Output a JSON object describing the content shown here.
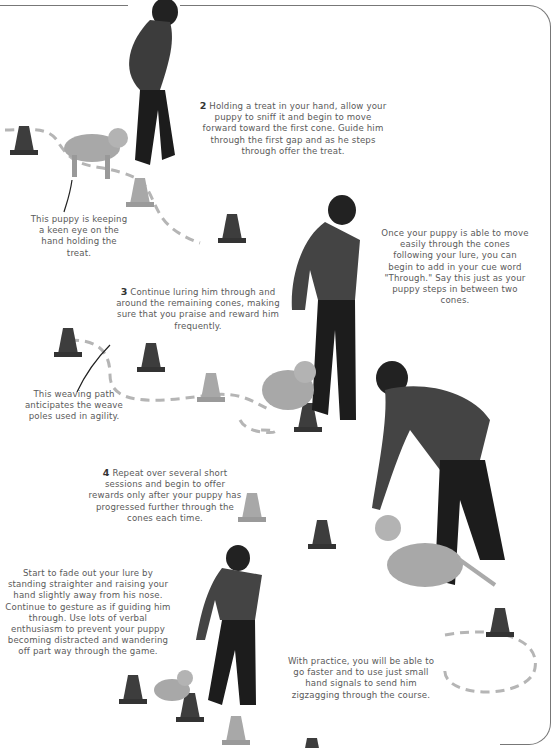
{
  "page": {
    "style": "grayscale instructional book page",
    "colors": {
      "frame_line": "#777777",
      "text": "#5a5a5a",
      "step_number": "#333333",
      "path_dash": "#b5b5b5",
      "cone": "#3d3d3d",
      "cone_light": "#9a9a9a"
    }
  },
  "steps": [
    {
      "number": "2",
      "text": "Holding a treat in your hand, allow your puppy to sniff it and begin to move forward toward the first cone. Guide him through the first gap and as he steps through offer the treat."
    },
    {
      "number": "3",
      "text": "Continue luring him through and around the remaining cones, making sure that you praise and reward him frequently."
    },
    {
      "number": "4",
      "text": "Repeat over several short sessions and begin to offer rewards only after your puppy has progressed further through the cones each time."
    }
  ],
  "captions": {
    "puppy_keen": "This puppy is keeping a keen eye on the hand holding the treat.",
    "weaving_path": "This weaving path anticipates the weave poles used in agility.",
    "cue_word": "Once your puppy is able to move easily through the cones following your lure, you can begin to add in your cue word \"Through.\" Say this just as your puppy steps in between two cones.",
    "fade_lure": "Start to fade out your lure by standing straighter and raising your hand slightly away from his nose. Continue to gesture as if guiding him through. Use lots of verbal enthusiasm to prevent your puppy becoming distracted and wandering off part way through the game.",
    "practice": "With practice, you will be able to go faster and to use just small hand signals to send him zigzagging through the course."
  },
  "illustrations": [
    {
      "id": "trainer-1",
      "description": "woman leaning forward with treat, puppy following"
    },
    {
      "id": "trainer-2",
      "description": "woman luring puppy around a cone"
    },
    {
      "id": "trainer-3",
      "description": "woman bending to puppy nose level"
    },
    {
      "id": "trainer-4",
      "description": "woman standing straighter, puppy weaving cones"
    }
  ]
}
